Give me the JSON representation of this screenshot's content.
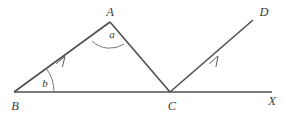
{
  "figure": {
    "name": "angle-diagram-parallel-rays",
    "background_color": "#ffffff",
    "line_color": "#4f4f4f",
    "arc_color": "#6a6a6a",
    "label_color": "#3c3c3c",
    "width": 285,
    "height": 116
  },
  "labels": {
    "vertex_a": "A",
    "vertex_b": "B",
    "vertex_c": "C",
    "vertex_d": "D",
    "vertex_x": "X",
    "angle_a": "a",
    "angle_b": "b"
  },
  "points": {
    "A": {
      "x": 110,
      "y": 22
    },
    "B": {
      "x": 14,
      "y": 92
    },
    "C": {
      "x": 170,
      "y": 92
    },
    "D": {
      "x": 253,
      "y": 20
    },
    "X": {
      "x": 272,
      "y": 92
    }
  },
  "segments": [
    {
      "name": "segment-BA",
      "from": "B",
      "to": "A",
      "arrow_mark": true
    },
    {
      "name": "segment-AC",
      "from": "A",
      "to": "C",
      "arrow_mark": false
    },
    {
      "name": "ray-CD",
      "from": "C",
      "to": "D",
      "arrow_mark": true
    },
    {
      "name": "line-BX",
      "from": "B",
      "to": "X",
      "arrow_mark": false
    }
  ],
  "angles": [
    {
      "name": "angle-at-A",
      "label": "a",
      "vertex": "A",
      "radius": 26
    },
    {
      "name": "angle-at-B",
      "label": "b",
      "vertex": "B",
      "radius": 40
    }
  ],
  "label_positions": {
    "A": {
      "x": 110,
      "y": 16
    },
    "B": {
      "x": 15,
      "y": 109
    },
    "C": {
      "x": 172,
      "y": 109
    },
    "D": {
      "x": 263,
      "y": 16
    },
    "X": {
      "x": 271,
      "y": 104
    },
    "a": {
      "x": 113,
      "y": 38
    },
    "b": {
      "x": 45,
      "y": 87
    }
  }
}
